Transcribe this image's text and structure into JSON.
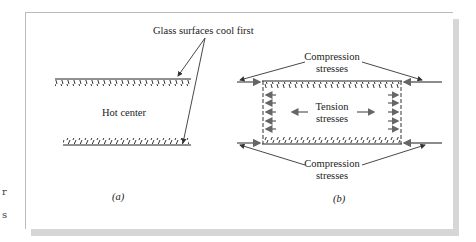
{
  "figure": {
    "panel_a": {
      "callout_label": "Glass surfaces cool first",
      "center_label": "Hot center",
      "caption": "(a)"
    },
    "panel_b": {
      "top_label_line1": "Compression",
      "top_label_line2": "stresses",
      "center_label_line1": "Tension",
      "center_label_line2": "stresses",
      "bottom_label_line1": "Compression",
      "bottom_label_line2": "stresses",
      "caption": "(b)"
    },
    "margin_fragments": [
      "r",
      "s"
    ],
    "colors": {
      "line": "#222222",
      "arrow_gray": "#666666",
      "shadow": "#d6d6d6"
    }
  }
}
